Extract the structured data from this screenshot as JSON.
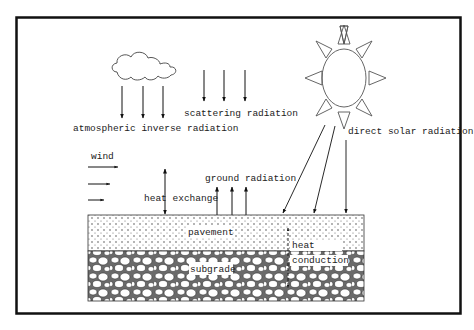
{
  "diagram": {
    "labels": {
      "atmospheric_inverse_radiation": "atmospheric inverse radiation",
      "scattering_radiation": "scattering radiation",
      "direct_solar_radiation": "direct solar radiation",
      "wind": "wind",
      "heat_exchange": "heat exchange",
      "ground_radiation": "ground radiation",
      "pavement": "pavement",
      "subgrade": "subgrade",
      "heat": "heat",
      "conduction": "conduction"
    },
    "icons": {
      "cloud": "cloud-icon",
      "sun": "sun-icon"
    },
    "colors": {
      "line": "#222222",
      "frame": "#111111",
      "background": "#ffffff"
    }
  }
}
